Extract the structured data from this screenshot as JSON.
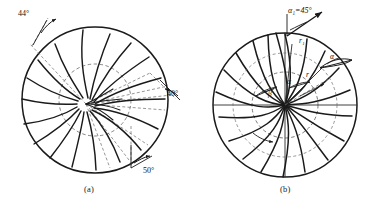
{
  "figure": {
    "kind": "technical-line-drawing",
    "background_color": "#ffffff",
    "ink_color": "#1a1a1a",
    "dashed_color": "#555555"
  },
  "panel_a": {
    "caption": "(a)",
    "blade_count": 18,
    "annotations": [
      {
        "id": "ang-44",
        "label": "44",
        "degree": "°",
        "text": "44°"
      },
      {
        "id": "ang-40",
        "label": "40",
        "degree": "°",
        "text": "40°"
      },
      {
        "id": "ang-50",
        "label": "50",
        "degree": "°",
        "text": "50°"
      }
    ],
    "outer_circle": {
      "cx": 95,
      "cy": 100,
      "r": 73
    },
    "inner_circle": {
      "cx": 95,
      "cy": 100,
      "r": 36
    },
    "focus": {
      "x": 86,
      "y": 104
    }
  },
  "panel_b": {
    "caption": "(b)",
    "blade_count": 20,
    "annotations": [
      {
        "id": "alpha1",
        "text": "α₁=45°",
        "base": "α",
        "sub": "1",
        "value": "=45",
        "degree": "°"
      },
      {
        "id": "r1",
        "text": "r₁",
        "base": "r",
        "sub": "1"
      },
      {
        "id": "r",
        "text": "r",
        "base": "r",
        "sub": ""
      },
      {
        "id": "alpha-out",
        "text": "α",
        "base": "α",
        "sub": ""
      },
      {
        "id": "alpha-mid",
        "text": "α",
        "base": "α",
        "sub": ""
      },
      {
        "id": "beta",
        "text": "β",
        "base": "β",
        "sub": ""
      }
    ],
    "outer_circle": {
      "cx": 285,
      "cy": 105,
      "r": 72
    },
    "inner_circle": {
      "cx": 285,
      "cy": 105,
      "r": 33
    },
    "center": {
      "x": 285,
      "y": 105
    }
  }
}
